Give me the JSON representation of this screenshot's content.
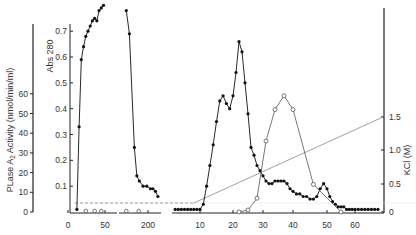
{
  "chart_data": {
    "type": "line",
    "title": "",
    "xlabel": "",
    "axes": {
      "left_outer": {
        "label": "PLase A2 Activity (nmol/min/ml)",
        "label_main": "PLase A",
        "label_sub": "2",
        "label_rest": " Activity (nmol/min/ml)",
        "ticks": [
          0,
          10,
          20,
          30,
          40,
          50,
          60
        ],
        "range": [
          0,
          60
        ]
      },
      "left_inner": {
        "label": "Abs 280",
        "ticks": [
          0.1,
          0.2,
          0.3,
          0.4,
          0.5,
          0.6,
          0.7
        ],
        "range": [
          0,
          0.75
        ]
      },
      "right": {
        "label": "KCl (M)",
        "ticks": [
          0,
          0.5,
          1.0,
          1.5
        ],
        "range": [
          0,
          1.5
        ]
      },
      "x": {
        "segments": [
          {
            "name": "loading",
            "ticks": [
              0,
              50
            ]
          },
          {
            "name": "wash",
            "ticks": [
              200
            ]
          },
          {
            "name": "gradient",
            "ticks": [
              10,
              20,
              30,
              40,
              50,
              60
            ]
          }
        ]
      }
    },
    "series": [
      {
        "name": "Abs 280 (loading)",
        "marker": "filled-circle",
        "segment": "loading",
        "x": [
          12,
          15,
          18,
          21,
          24,
          27,
          30,
          33,
          36,
          39,
          42,
          45,
          48
        ],
        "y": [
          0.01,
          0.33,
          0.59,
          0.64,
          0.68,
          0.7,
          0.72,
          0.74,
          0.75,
          0.74,
          0.78,
          0.79,
          0.8
        ]
      },
      {
        "name": "Abs 280 (wash)",
        "marker": "filled-circle",
        "segment": "wash",
        "x": [
          165,
          170,
          178,
          182,
          186,
          192,
          198,
          204,
          208,
          212,
          216
        ],
        "y": [
          0.78,
          0.69,
          0.25,
          0.14,
          0.12,
          0.1,
          0.1,
          0.09,
          0.09,
          0.08,
          0.06
        ]
      },
      {
        "name": "Abs 280 (gradient)",
        "marker": "filled-circle",
        "segment": "gradient",
        "x": [
          2,
          3,
          4,
          5,
          6,
          7,
          8,
          9,
          10,
          11,
          12,
          13,
          14,
          15,
          16,
          17,
          18,
          19,
          20,
          21,
          22,
          23,
          24,
          25,
          26,
          27,
          28,
          29,
          30,
          31,
          32,
          33,
          34,
          35,
          36,
          37,
          38,
          39,
          40,
          41,
          42,
          43,
          44,
          45,
          46,
          47,
          48,
          49,
          50,
          51,
          52,
          53,
          54,
          55,
          56,
          57,
          58,
          59,
          60,
          61,
          62,
          63,
          64,
          65,
          66,
          67
        ],
        "y": [
          0.01,
          0.01,
          0.01,
          0.01,
          0.01,
          0.01,
          0.01,
          0.01,
          0.01,
          0.03,
          0.1,
          0.18,
          0.26,
          0.35,
          0.43,
          0.45,
          0.42,
          0.4,
          0.45,
          0.54,
          0.66,
          0.62,
          0.5,
          0.38,
          0.25,
          0.22,
          0.18,
          0.16,
          0.14,
          0.12,
          0.11,
          0.11,
          0.12,
          0.12,
          0.12,
          0.12,
          0.11,
          0.09,
          0.08,
          0.07,
          0.07,
          0.06,
          0.06,
          0.05,
          0.05,
          0.06,
          0.09,
          0.11,
          0.09,
          0.06,
          0.04,
          0.03,
          0.02,
          0.02,
          0.02,
          0.01,
          0.01,
          0.01,
          0.01,
          0.01,
          0.01,
          0.01,
          0.01,
          0.01,
          0.01,
          0.01
        ]
      },
      {
        "name": "PLase A2 activity",
        "marker": "open-circle",
        "segment": "gradient",
        "x": [
          22,
          25,
          28,
          31,
          34,
          37,
          40,
          46,
          55
        ],
        "y": [
          0,
          1,
          7,
          36,
          52,
          59,
          52,
          14,
          0
        ],
        "extra_zero_points": {
          "loading": [
            24,
            36,
            45
          ],
          "wash": [
            165,
            185
          ]
        }
      },
      {
        "name": "KCl gradient",
        "style": "dashed-then-solid",
        "segment": "gradient",
        "x": [
          0,
          8,
          30,
          43,
          67
        ],
        "y": [
          0.12,
          0.12,
          0.66,
          0.95,
          1.5
        ]
      }
    ]
  }
}
